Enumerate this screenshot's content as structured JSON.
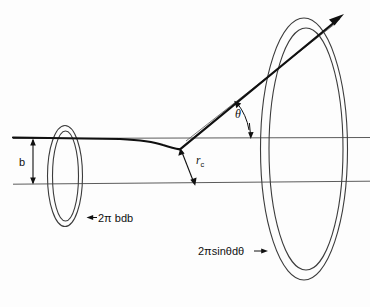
{
  "figure": {
    "background_color": "#fdfdfd",
    "ink_color": "#101010",
    "thin_line_color": "#555555",
    "width": 370,
    "height": 307
  },
  "labels": {
    "impact_parameter": "b",
    "scattering_angle": "θ",
    "closest_approach_base": "r",
    "closest_approach_sub": "c",
    "incident_annulus_area": "2π bdb",
    "scattered_annulus_area": "2πsinθdθ"
  },
  "annotations": {
    "incident_annulus_arrow": "arrow-pointing-left-to-small-ring",
    "scattered_annulus_arrow": "arrow-pointing-right-to-large-ring",
    "b_arrow": "vertical-double-headed-arrow",
    "rc_arrow": "double-headed-arrow-from-vertex-to-lower-axis",
    "theta_arc": "curved-arc-between-trajectory-and-axis",
    "trajectory_arrowhead": "outgoing-particle-direction"
  },
  "geometry": {
    "small_ring": {
      "center_x": 65,
      "center_y": 176,
      "outer_rx": 17,
      "outer_ry": 50,
      "inner_rx": 13,
      "inner_ry": 45
    },
    "large_ring": {
      "center_x": 305,
      "center_y": 148,
      "outer_rx": 43,
      "outer_ry": 130,
      "inner_rx": 37,
      "inner_ry": 121
    },
    "upper_axis_y": 138,
    "lower_axis_y": 183,
    "scatter_vertex_x": 180,
    "scatter_vertex_y": 149,
    "theta_degrees": 42
  }
}
